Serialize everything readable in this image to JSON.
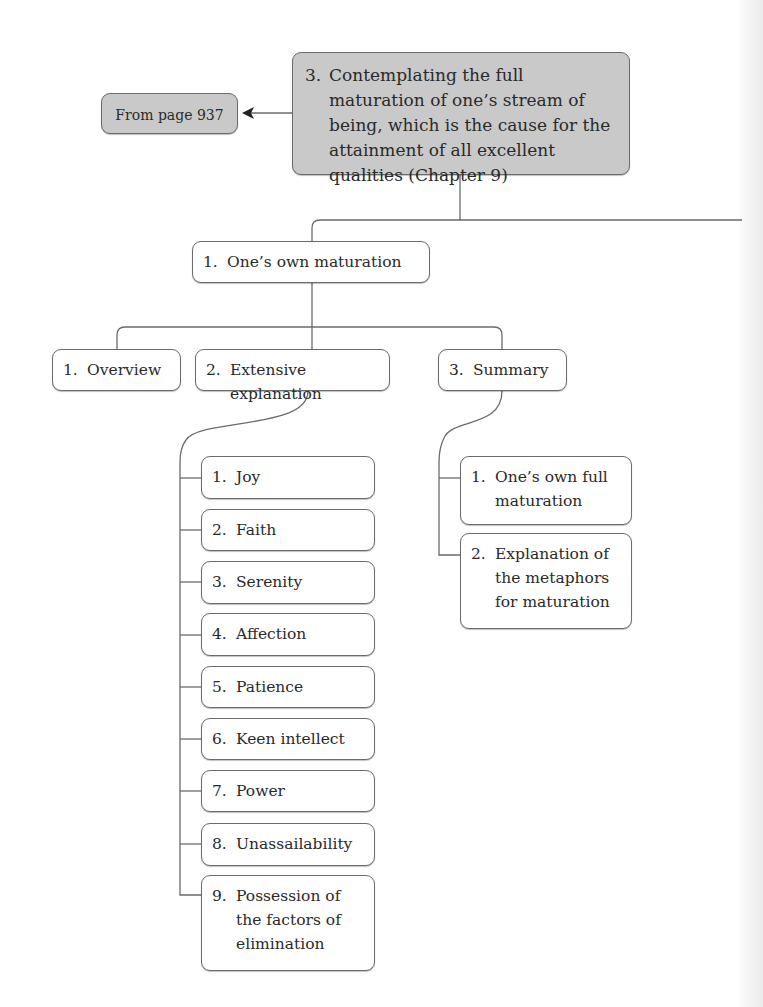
{
  "root": {
    "number": "3.",
    "label": "Contemplating the full maturation of one’s stream of being, which is the cause for the attainment of all excellent qualities (Chapter 9)"
  },
  "from_page": {
    "label": "From page 937"
  },
  "level1": {
    "number": "1.",
    "label": "One’s own maturation"
  },
  "level2": [
    {
      "number": "1.",
      "label": "Overview"
    },
    {
      "number": "2.",
      "label": "Extensive explanation"
    },
    {
      "number": "3.",
      "label": "Summary"
    }
  ],
  "extensive_children": [
    {
      "number": "1.",
      "label": "Joy"
    },
    {
      "number": "2.",
      "label": "Faith"
    },
    {
      "number": "3.",
      "label": "Serenity"
    },
    {
      "number": "4.",
      "label": "Affection"
    },
    {
      "number": "5.",
      "label": "Patience"
    },
    {
      "number": "6.",
      "label": "Keen intellect"
    },
    {
      "number": "7.",
      "label": "Power"
    },
    {
      "number": "8.",
      "label": "Unassailability"
    },
    {
      "number": "9.",
      "label": "Possession of the factors of elimination"
    }
  ],
  "summary_children": [
    {
      "number": "1.",
      "label": "One’s own full maturation"
    },
    {
      "number": "2.",
      "label": "Explanation of the metaphors for maturation"
    }
  ],
  "colors": {
    "root_fill": "#c9c9c9",
    "box_fill": "#ffffff",
    "line": "#6b6b6b"
  }
}
